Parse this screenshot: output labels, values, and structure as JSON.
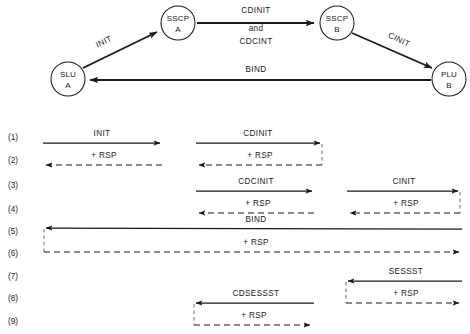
{
  "figure": {
    "colors": {
      "ink": "#1a1a1a",
      "connector": "#6a6a6a",
      "background": "#ffffff"
    }
  },
  "topology": {
    "nodes": [
      {
        "id": "slu-a",
        "line1": "SLU",
        "line2": "A",
        "cx": 68,
        "cy": 79,
        "r": 17
      },
      {
        "id": "sscp-a",
        "line1": "SSCP",
        "line2": "A",
        "cx": 178,
        "cy": 23,
        "r": 17
      },
      {
        "id": "sscp-b",
        "line1": "SSCP",
        "line2": "B",
        "cx": 337,
        "cy": 23,
        "r": 17
      },
      {
        "id": "plu-b",
        "line1": "PLU",
        "line2": "B",
        "cx": 449,
        "cy": 79,
        "r": 17
      }
    ],
    "edges": [
      {
        "id": "edge-init",
        "label": "INIT",
        "from": "slu-a",
        "to": "sscp-a"
      },
      {
        "id": "edge-cdinit",
        "label": "CDINIT and CDCINT",
        "from": "sscp-a",
        "to": "sscp-b"
      },
      {
        "id": "edge-cinit",
        "label": "CINIT",
        "from": "sscp-b",
        "to": "plu-b"
      },
      {
        "id": "edge-bind",
        "label": "BIND",
        "from": "plu-b",
        "to": "slu-a"
      }
    ],
    "edge_labels": {
      "init": "INIT",
      "cdinit": "CDINIT",
      "and": "and",
      "cdcint": "CDCINT",
      "cinit": "CINIT",
      "bind": "BIND"
    }
  },
  "sequence": {
    "rows": [
      {
        "num": "(1)",
        "label": "INIT",
        "rsp": false
      },
      {
        "num": "(2)",
        "label": "+ RSP",
        "rsp": true
      },
      {
        "num": "(3)",
        "label": "CDCINIT",
        "rsp": false
      },
      {
        "num": "(4)",
        "label": "+ RSP",
        "rsp": true
      },
      {
        "num": "(5)",
        "label": "BIND",
        "rsp": false
      },
      {
        "num": "(6)",
        "label": "+ RSP",
        "rsp": true
      },
      {
        "num": "(7)",
        "label": "SESSST",
        "rsp": false
      },
      {
        "num": "(8)",
        "label": "CDSESSST",
        "rsp": false
      },
      {
        "num": "(9)",
        "label": "+ RSP",
        "rsp": true
      }
    ],
    "row_numbers": [
      "(1)",
      "(2)",
      "(3)",
      "(4)",
      "(5)",
      "(6)",
      "(7)",
      "(8)",
      "(9)"
    ],
    "flow_labels": {
      "init": "INIT",
      "init_rsp": "+ RSP",
      "cdinit": "CDINIT",
      "cdinit_rsp": "+ RSP",
      "cdcinit": "CDCINIT",
      "cdcinit_rsp": "+ RSP",
      "cinit": "CINIT",
      "cinit_rsp": "+ RSP",
      "bind": "BIND",
      "bind_rsp": "+ RSP",
      "sessst": "SESSST",
      "sessst_rsp": "+ RSP",
      "cdsessst": "CDSESSST",
      "cdsessst_rsp": "+ RSP"
    }
  }
}
